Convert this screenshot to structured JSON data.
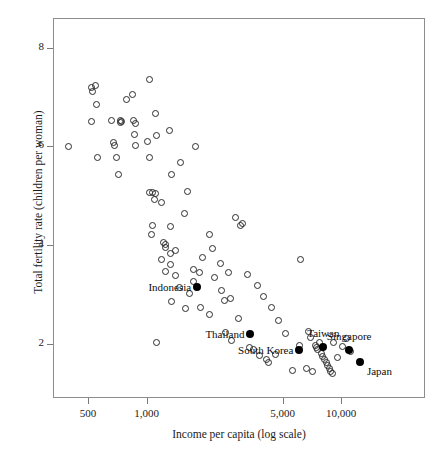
{
  "chart_data": {
    "type": "scatter",
    "title": "",
    "xlabel": "Income per capita (log scale)",
    "ylabel": "Total fertility rate (children per woman)",
    "xscale": "log",
    "xticks": [
      500,
      1000,
      5000,
      10000
    ],
    "xticklabels": [
      "500",
      "1,000",
      "5,000",
      "10,000"
    ],
    "yticks": [
      8,
      6,
      4,
      2
    ],
    "yticklabels": [
      "8",
      "6",
      "4",
      "2"
    ],
    "xlim": [
      330,
      27000
    ],
    "ylim": [
      0.9,
      8.6
    ],
    "grid": false,
    "legend": null,
    "series": [
      {
        "name": "Other countries",
        "marker": "open-circle",
        "color": "#2b2b2b",
        "points": [
          [
            395,
            5.99
          ],
          [
            520,
            7.2
          ],
          [
            527,
            7.12
          ],
          [
            545,
            7.24
          ],
          [
            553,
            6.85
          ],
          [
            520,
            6.5
          ],
          [
            560,
            5.77
          ],
          [
            660,
            6.53
          ],
          [
            672,
            6.07
          ],
          [
            680,
            6.02
          ],
          [
            700,
            5.78
          ],
          [
            730,
            6.52
          ],
          [
            742,
            6.5
          ],
          [
            735,
            6.48
          ],
          [
            720,
            5.43
          ],
          [
            790,
            6.94
          ],
          [
            845,
            7.04
          ],
          [
            860,
            6.52
          ],
          [
            862,
            6.24
          ],
          [
            880,
            6.46
          ],
          [
            872,
            6.02
          ],
          [
            1010,
            6.09
          ],
          [
            1030,
            5.77
          ],
          [
            1040,
            7.36
          ],
          [
            1110,
            6.66
          ],
          [
            1120,
            6.22
          ],
          [
            1035,
            5.06
          ],
          [
            1075,
            5.07
          ],
          [
            1105,
            5.05
          ],
          [
            1095,
            4.92
          ],
          [
            1190,
            4.87
          ],
          [
            1075,
            4.4
          ],
          [
            1055,
            4.22
          ],
          [
            1310,
            6.32
          ],
          [
            1340,
            5.43
          ],
          [
            1320,
            4.38
          ],
          [
            1500,
            5.67
          ],
          [
            1620,
            5.08
          ],
          [
            1790,
            5.99
          ],
          [
            1560,
            4.63
          ],
          [
            1225,
            4.06
          ],
          [
            1250,
            4.02
          ],
          [
            1245,
            3.95
          ],
          [
            1330,
            3.82
          ],
          [
            1195,
            3.7
          ],
          [
            1410,
            3.89
          ],
          [
            1330,
            3.6
          ],
          [
            1250,
            3.46
          ],
          [
            1400,
            3.38
          ],
          [
            1480,
            3.14
          ],
          [
            1350,
            2.85
          ],
          [
            1580,
            2.71
          ],
          [
            1120,
            2.02
          ],
          [
            1660,
            3.02
          ],
          [
            1735,
            3.51
          ],
          [
            1750,
            3.26
          ],
          [
            1940,
            3.75
          ],
          [
            1880,
            3.44
          ],
          [
            2100,
            4.21
          ],
          [
            2180,
            3.92
          ],
          [
            2230,
            3.34
          ],
          [
            2390,
            3.62
          ],
          [
            2420,
            3.08
          ],
          [
            2500,
            2.87
          ],
          [
            2640,
            3.44
          ],
          [
            2700,
            2.92
          ],
          [
            2860,
            4.55
          ],
          [
            3050,
            4.4
          ],
          [
            3100,
            4.44
          ],
          [
            2550,
            2.22
          ],
          [
            2720,
            2.06
          ],
          [
            3400,
            1.93
          ],
          [
            3560,
            1.88
          ],
          [
            3800,
            1.76
          ],
          [
            4150,
            1.68
          ],
          [
            4230,
            1.62
          ],
          [
            4600,
            1.79
          ],
          [
            5600,
            1.45
          ],
          [
            6200,
            3.71
          ],
          [
            6800,
            2.25
          ],
          [
            7000,
            2.12
          ],
          [
            7350,
            1.97
          ],
          [
            7480,
            1.93
          ],
          [
            7600,
            1.88
          ],
          [
            7720,
            2.02
          ],
          [
            7900,
            1.8
          ],
          [
            8050,
            1.74
          ],
          [
            8200,
            1.69
          ],
          [
            8400,
            1.62
          ],
          [
            8560,
            1.56
          ],
          [
            8700,
            1.5
          ],
          [
            8850,
            1.44
          ],
          [
            9000,
            1.39
          ],
          [
            6600,
            1.5
          ],
          [
            7100,
            1.44
          ],
          [
            9600,
            1.72
          ],
          [
            10200,
            1.94
          ],
          [
            10600,
            2.1
          ],
          [
            11200,
            1.84
          ],
          [
            9100,
            2.03
          ],
          [
            5200,
            2.2
          ],
          [
            4750,
            2.48
          ],
          [
            4400,
            2.74
          ],
          [
            4000,
            2.96
          ],
          [
            3700,
            3.18
          ],
          [
            3300,
            3.4
          ],
          [
            2950,
            2.52
          ],
          [
            2100,
            2.6
          ],
          [
            1900,
            2.74
          ],
          [
            6100,
            1.96
          ]
        ]
      },
      {
        "name": "Highlighted economies",
        "marker": "filled-circle",
        "color": "#000000",
        "points": [
          {
            "label": "Indonesia",
            "x": 1820,
            "y": 3.14,
            "label_pos": "right"
          },
          {
            "label": "Thailand",
            "x": 3420,
            "y": 2.2,
            "label_pos": "right"
          },
          {
            "label": "South Korea",
            "x": 6100,
            "y": 1.88,
            "label_pos": "right"
          },
          {
            "label": "Taiwan",
            "x": 8100,
            "y": 1.93,
            "label_pos": "above"
          },
          {
            "label": "Singapore",
            "x": 11000,
            "y": 1.88,
            "label_pos": "above"
          },
          {
            "label": "Japan",
            "x": 12500,
            "y": 1.62,
            "label_pos": "left"
          }
        ]
      }
    ],
    "annotations": [
      {
        "text": "Indonesia",
        "anchor": "right"
      },
      {
        "text": "Thailand",
        "anchor": "right"
      },
      {
        "text": "South Korea",
        "anchor": "right"
      },
      {
        "text": "Taiwan",
        "anchor": "above"
      },
      {
        "text": "Singapore",
        "anchor": "above"
      },
      {
        "text": "Japan",
        "anchor": "left"
      }
    ],
    "colors": {
      "marker_outline": "#2b2b2b",
      "marker_fill": "#000000",
      "frame": "#8d8d8d",
      "background": "#ffffff",
      "text": "#111111"
    }
  }
}
